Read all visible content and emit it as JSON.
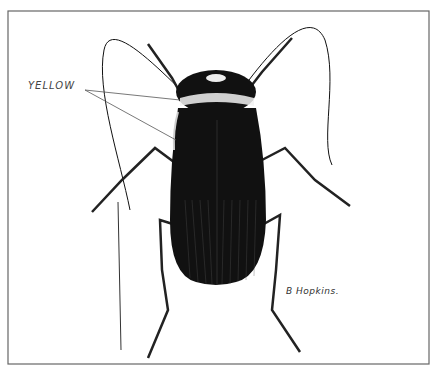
{
  "illustration": {
    "subject": "cockroach",
    "style": "black-and-white pen-and-ink scientific drawing",
    "annotation_label": "YELLOW",
    "signature": "B Hopkins.",
    "scale_bar": "vertical line, left of specimen",
    "colors": {
      "ink": "#111111",
      "paper": "#ffffff",
      "frame": "#555555"
    }
  }
}
